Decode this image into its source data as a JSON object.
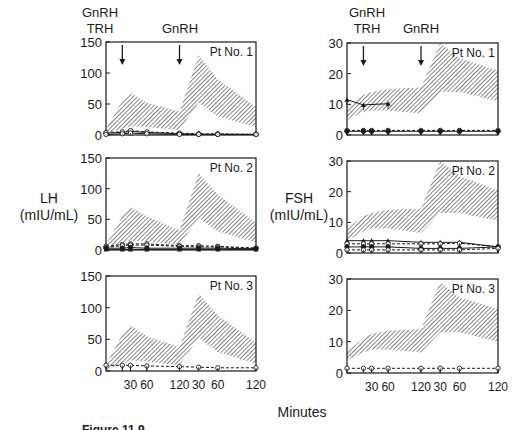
{
  "figure": {
    "caption_partial": "Figure 11.9",
    "x_axis_label": "Minutes",
    "left_ylabel_line1": "LH",
    "left_ylabel_line2": "(mIU/mL)",
    "right_ylabel_line1": "FSH",
    "right_ylabel_line2": "(mIU/mL)",
    "annotations": {
      "first_injection_line1": "GnRH",
      "first_injection_line2": "TRH",
      "second_injection": "GnRH"
    },
    "colors": {
      "ink": "#1a1a1a",
      "hatch": "#333333",
      "background": "#ffffff"
    }
  },
  "chart_data": [
    {
      "type": "line",
      "title": "Pt No. 1",
      "hormone": "LH",
      "ylabel": "LH (mIU/mL)",
      "xlabel": "Minutes",
      "ylim": [
        0,
        150
      ],
      "yticks": [
        0,
        50,
        100,
        150
      ],
      "x_tick_labels": [
        "30",
        "60",
        "120",
        "30",
        "60",
        "120"
      ],
      "x": [
        -15,
        15,
        30,
        60,
        120,
        150,
        180,
        240
      ],
      "normal_range": {
        "upper": [
          10,
          55,
          68,
          52,
          38,
          128,
          90,
          45
        ],
        "lower": [
          2,
          10,
          14,
          13,
          8,
          52,
          30,
          13
        ]
      },
      "series": [
        {
          "name": "patient-a",
          "style": "solid-filled",
          "values": [
            3,
            4,
            6,
            4,
            2,
            1,
            1,
            1
          ]
        },
        {
          "name": "patient-b",
          "style": "dashed-open",
          "values": [
            4,
            5,
            7,
            5,
            3,
            2,
            2,
            1
          ]
        },
        {
          "name": "patient-c",
          "style": "solid-open",
          "values": [
            1,
            2,
            3,
            2,
            1,
            1,
            1,
            1
          ]
        }
      ],
      "annotations": [
        {
          "x": 15,
          "text": "GnRH / TRH"
        },
        {
          "x": 120,
          "text": "GnRH"
        }
      ]
    },
    {
      "type": "line",
      "title": "Pt No. 1",
      "hormone": "FSH",
      "ylabel": "FSH (mIU/mL)",
      "xlabel": "Minutes",
      "ylim": [
        0,
        30
      ],
      "yticks": [
        0,
        10,
        20,
        30
      ],
      "x_tick_labels": [
        "30",
        "60",
        "120",
        "30",
        "60",
        "120"
      ],
      "x": [
        -15,
        15,
        30,
        60,
        120,
        150,
        180,
        240
      ],
      "normal_range": {
        "upper": [
          9,
          13,
          14,
          15,
          15.5,
          30,
          25,
          21
        ],
        "lower": [
          5,
          7.5,
          8,
          8,
          7,
          14,
          14,
          11
        ]
      },
      "series": [
        {
          "name": "patient-a",
          "style": "solid-filled-triangle",
          "x": [
            -15,
            15,
            60
          ],
          "values": [
            11.5,
            9.8,
            10.2
          ]
        },
        {
          "name": "patient-b",
          "style": "dashed-open",
          "values": [
            1.5,
            1.5,
            1.5,
            1.5,
            1.5,
            1.5,
            1.5,
            1.5
          ]
        },
        {
          "name": "patient-c",
          "style": "solid-filled",
          "values": [
            1.2,
            1.2,
            1.2,
            1.2,
            1.2,
            1.2,
            1.2,
            1.2
          ]
        }
      ],
      "annotations": [
        {
          "x": 15,
          "text": "GnRH / TRH"
        },
        {
          "x": 120,
          "text": "GnRH"
        }
      ]
    },
    {
      "type": "line",
      "title": "Pt No. 2",
      "hormone": "LH",
      "ylabel": "LH (mIU/mL)",
      "xlabel": "Minutes",
      "ylim": [
        0,
        150
      ],
      "yticks": [
        0,
        50,
        100,
        150
      ],
      "x_tick_labels": [
        "30",
        "60",
        "120",
        "30",
        "60",
        "120"
      ],
      "x": [
        -15,
        15,
        30,
        60,
        120,
        150,
        180,
        240
      ],
      "normal_range": {
        "upper": [
          10,
          55,
          70,
          55,
          32,
          125,
          90,
          45
        ],
        "lower": [
          2,
          12,
          15,
          14,
          8,
          52,
          30,
          12
        ]
      },
      "series": [
        {
          "name": "patient-a",
          "style": "dashed-open",
          "values": [
            6,
            9,
            10,
            10,
            7,
            7,
            6,
            3
          ]
        },
        {
          "name": "patient-b",
          "style": "dashed-open",
          "values": [
            4,
            7,
            8,
            8,
            6,
            5,
            5,
            3
          ]
        },
        {
          "name": "patient-c",
          "style": "solid-filled",
          "values": [
            3,
            3,
            4,
            3,
            3,
            3,
            3,
            2
          ]
        },
        {
          "name": "patient-d",
          "style": "solid-filled-triangle",
          "values": [
            1,
            1,
            1,
            1,
            1,
            1,
            1,
            1
          ]
        }
      ]
    },
    {
      "type": "line",
      "title": "Pt No. 2",
      "hormone": "FSH",
      "ylabel": "FSH (mIU/mL)",
      "xlabel": "Minutes",
      "ylim": [
        0,
        30
      ],
      "yticks": [
        0,
        10,
        20,
        30
      ],
      "x_tick_labels": [
        "30",
        "60",
        "120",
        "30",
        "60",
        "120"
      ],
      "x": [
        -15,
        15,
        30,
        60,
        120,
        150,
        180,
        240
      ],
      "normal_range": {
        "upper": [
          8,
          12,
          13,
          14,
          14.5,
          30,
          25,
          20.5
        ],
        "lower": [
          4,
          7,
          8,
          8,
          6.5,
          13,
          13,
          10.5
        ]
      },
      "series": [
        {
          "name": "patient-a",
          "style": "solid-filled-triangle",
          "values": [
            4,
            4,
            4,
            4,
            3.5,
            3.5,
            3.5,
            2
          ]
        },
        {
          "name": "patient-b",
          "style": "dashed-open",
          "values": [
            3,
            3,
            3,
            3,
            3,
            3,
            3.2,
            2
          ]
        },
        {
          "name": "patient-c",
          "style": "solid-filled",
          "values": [
            2,
            2,
            2,
            2,
            1.5,
            1.5,
            1.5,
            2
          ]
        },
        {
          "name": "patient-d",
          "style": "dashed-open",
          "values": [
            1,
            1,
            1,
            1,
            1,
            1,
            1,
            1.5
          ]
        }
      ]
    },
    {
      "type": "line",
      "title": "Pt No. 3",
      "hormone": "LH",
      "ylabel": "LH (mIU/mL)",
      "xlabel": "Minutes",
      "ylim": [
        0,
        150
      ],
      "yticks": [
        0,
        50,
        100,
        150
      ],
      "x_tick_labels": [
        "30",
        "60",
        "120",
        "30",
        "60",
        "120"
      ],
      "x": [
        -15,
        15,
        30,
        60,
        120,
        150,
        180,
        240
      ],
      "normal_range": {
        "upper": [
          10,
          58,
          72,
          55,
          38,
          122,
          88,
          45
        ],
        "lower": [
          2,
          12,
          17,
          15,
          9,
          52,
          30,
          12
        ]
      },
      "series": [
        {
          "name": "patient-a",
          "style": "dashed-open",
          "values": [
            9,
            9,
            9,
            8,
            7,
            6,
            5,
            5
          ]
        }
      ]
    },
    {
      "type": "line",
      "title": "Pt No. 3",
      "hormone": "FSH",
      "ylabel": "FSH (mIU/mL)",
      "xlabel": "Minutes",
      "ylim": [
        0,
        30
      ],
      "yticks": [
        0,
        10,
        20,
        30
      ],
      "x_tick_labels": [
        "30",
        "60",
        "120",
        "30",
        "60",
        "120"
      ],
      "x": [
        -15,
        15,
        30,
        60,
        120,
        150,
        180,
        240
      ],
      "normal_range": {
        "upper": [
          7,
          11,
          12.5,
          13.5,
          14,
          29,
          24,
          20.5
        ],
        "lower": [
          4,
          6.5,
          7.5,
          7.5,
          6.5,
          13,
          13,
          10
        ]
      },
      "series": [
        {
          "name": "patient-a",
          "style": "dashed-open",
          "values": [
            1.5,
            1.5,
            1.5,
            1.5,
            1.5,
            1.5,
            1.5,
            1.5
          ]
        }
      ]
    }
  ]
}
